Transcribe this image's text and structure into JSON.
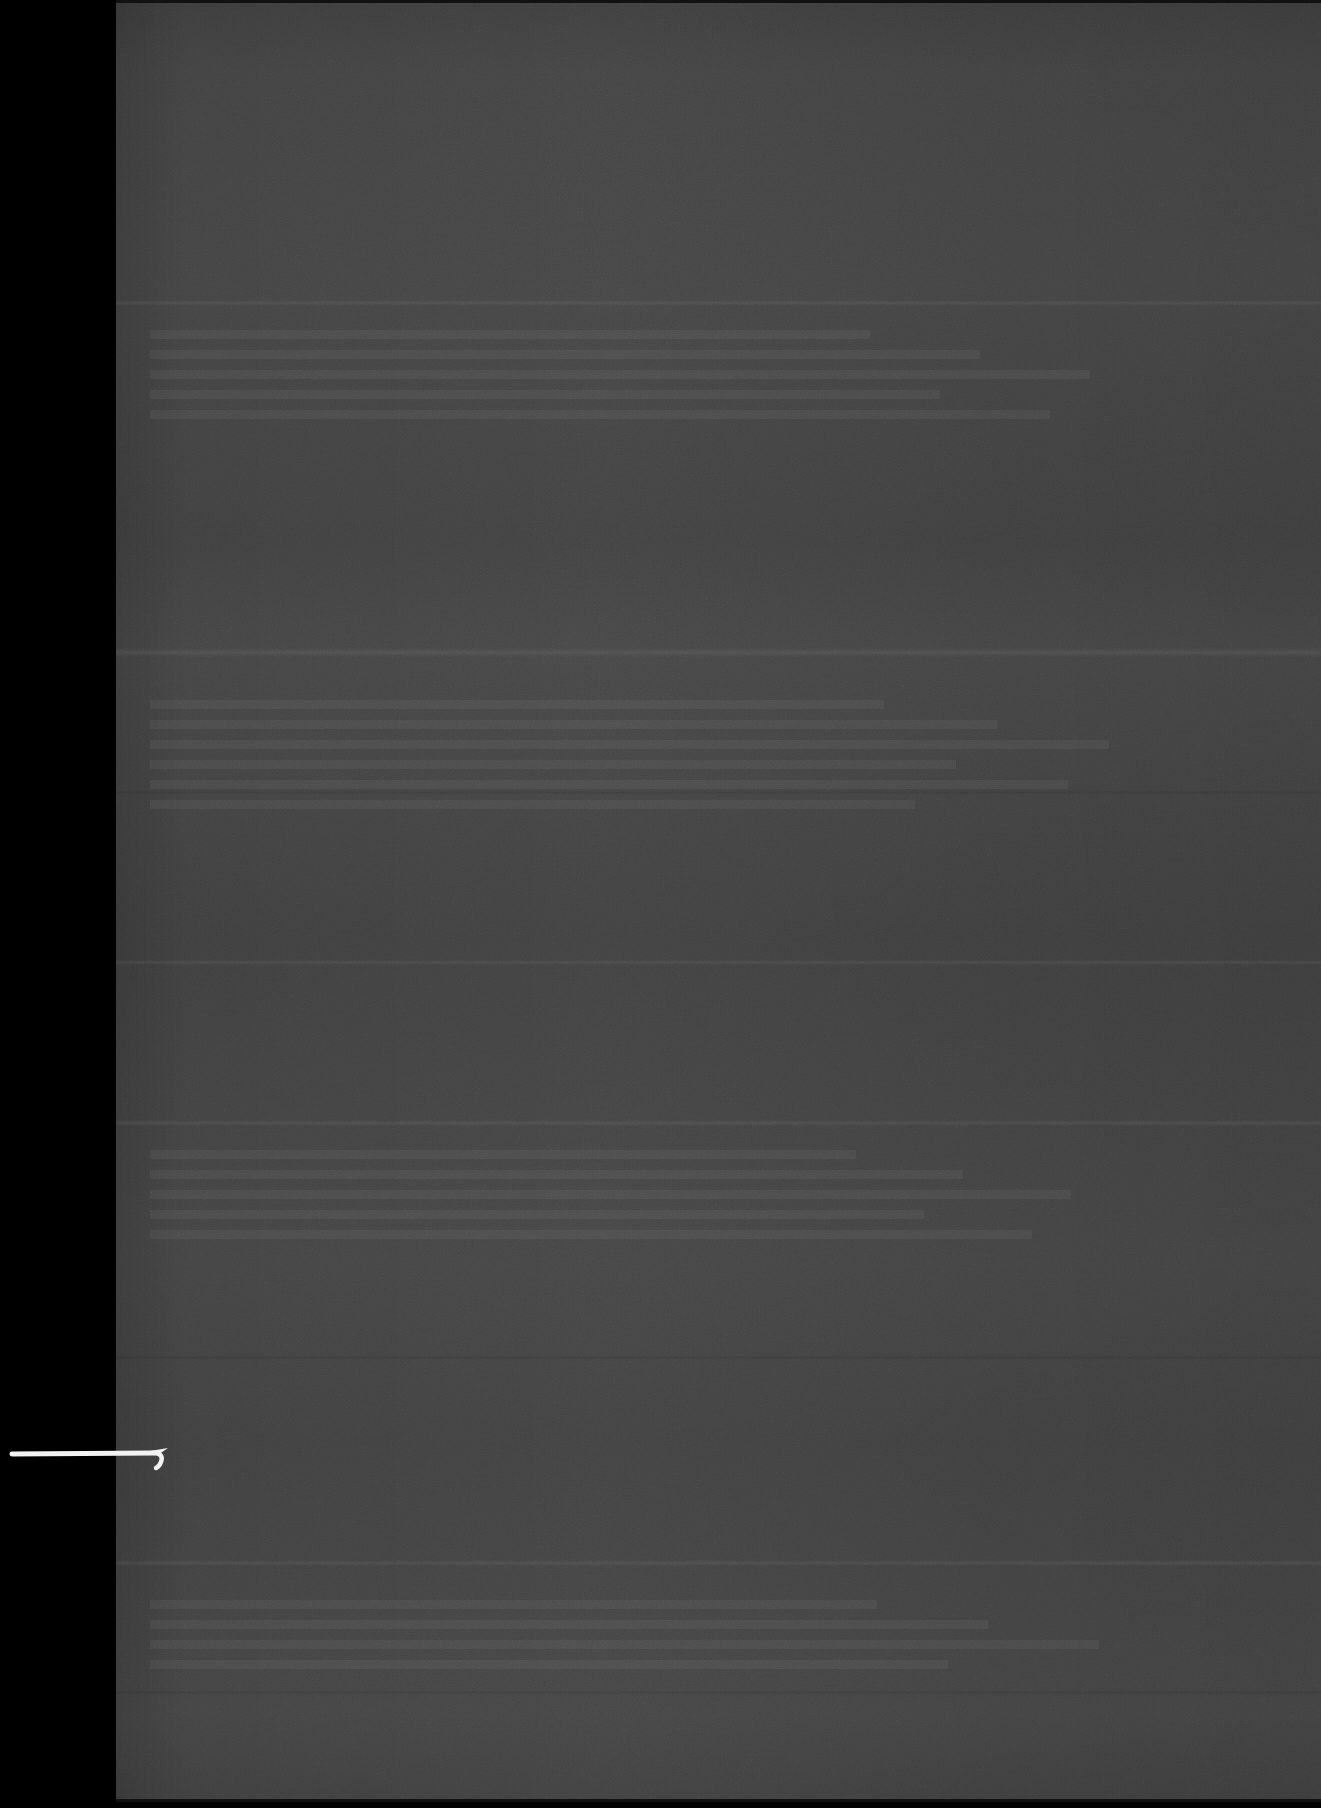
{
  "document": {
    "title": "Scanned page (underexposed)",
    "surface_color": "#434343",
    "margin_color": "#000000",
    "annotation_color": "#f2f2f2",
    "width_px": 1321,
    "height_px": 1808
  },
  "layout": {
    "left_margin": {
      "name": "left-black-margin",
      "x": 0,
      "y": 0,
      "width": 116,
      "height": 1808
    },
    "page_surface": {
      "name": "page-surface",
      "x": 116,
      "y": 0,
      "width": 1205,
      "height": 1804
    },
    "bottom_strip": {
      "name": "bottom-black-strip",
      "x": 0,
      "y": 1802,
      "width": 1321,
      "height": 6
    }
  },
  "seams": [
    {
      "name": "seam-upper",
      "y": 300,
      "height": 6,
      "tone": "light"
    },
    {
      "name": "seam-mid-bright",
      "y": 648,
      "height": 9,
      "tone": "light"
    },
    {
      "name": "seam-lower-a",
      "y": 790,
      "height": 5,
      "tone": "dark"
    },
    {
      "name": "seam-lower-b",
      "y": 960,
      "height": 5,
      "tone": "light"
    },
    {
      "name": "seam-lower-c",
      "y": 1120,
      "height": 6,
      "tone": "light"
    },
    {
      "name": "seam-lower-d",
      "y": 1355,
      "height": 5,
      "tone": "dark"
    },
    {
      "name": "seam-lower-e",
      "y": 1560,
      "height": 6,
      "tone": "light"
    },
    {
      "name": "seam-lower-f",
      "y": 1690,
      "height": 5,
      "tone": "dark"
    }
  ],
  "ghost_content": [
    {
      "name": "ghost-paragraph-1",
      "x": 150,
      "y": 330,
      "width": 1000,
      "lines": 5
    },
    {
      "name": "ghost-paragraph-2",
      "x": 150,
      "y": 700,
      "width": 1020,
      "lines": 6
    },
    {
      "name": "ghost-paragraph-3",
      "x": 150,
      "y": 1150,
      "width": 980,
      "lines": 5
    },
    {
      "name": "ghost-paragraph-4",
      "x": 150,
      "y": 1600,
      "width": 1010,
      "lines": 4
    }
  ],
  "annotation": {
    "name": "ink-pointer-stroke",
    "description": "handwritten white pointer line with hooked arrow tip",
    "x": 4,
    "y": 1436,
    "width": 180,
    "height": 40,
    "stroke_color": "#f2f2f2",
    "line_start_x": 8,
    "line_end_x": 150,
    "line_y": 17,
    "line_thickness": 5
  }
}
